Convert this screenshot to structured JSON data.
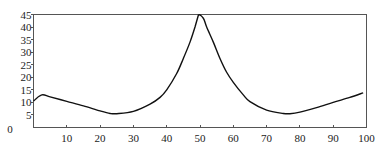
{
  "chart_data": {
    "type": "line",
    "title": "",
    "xlabel": "",
    "ylabel": "",
    "xlim": [
      0,
      100
    ],
    "ylim": [
      0,
      45
    ],
    "grid": false,
    "legend": null,
    "x_ticks": [
      0,
      10,
      20,
      30,
      40,
      50,
      60,
      70,
      80,
      90,
      100
    ],
    "y_ticks": [
      0,
      5,
      10,
      15,
      20,
      25,
      30,
      35,
      40,
      45
    ],
    "series": [
      {
        "name": "curve",
        "color": "#111111",
        "x": [
          0,
          2.5,
          5,
          10,
          15,
          20,
          23,
          25,
          30,
          35,
          38,
          40,
          43,
          45,
          47,
          48.5,
          49.5,
          51,
          52,
          54,
          56,
          58,
          60,
          63,
          65,
          70,
          75,
          77,
          80,
          85,
          90,
          95,
          99
        ],
        "values": [
          10.5,
          13,
          12.2,
          10.4,
          8.6,
          6.6,
          5.6,
          5.5,
          6.4,
          9.3,
          12,
          15,
          21.5,
          27.5,
          34,
          40,
          44.7,
          43.5,
          40,
          34,
          27.5,
          22,
          18,
          13,
          10.3,
          6.9,
          5.6,
          5.5,
          6.1,
          7.9,
          10,
          12,
          13.8
        ]
      }
    ]
  },
  "axes": {
    "x_tick_labels": [
      "0",
      "10",
      "20",
      "30",
      "40",
      "50",
      "60",
      "70",
      "80",
      "90",
      "100"
    ],
    "y_tick_labels": [
      "0",
      "5",
      "10",
      "15",
      "20",
      "25",
      "30",
      "35",
      "40",
      "45"
    ]
  }
}
